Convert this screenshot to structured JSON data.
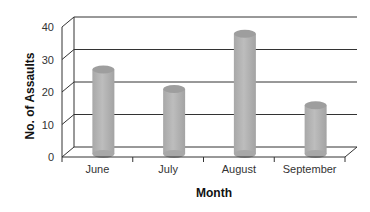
{
  "chart_data": {
    "type": "bar",
    "style": "3d-cylinder",
    "title": "",
    "xlabel": "Month",
    "ylabel": "No. of Assaults",
    "categories": [
      "June",
      "July",
      "August",
      "September"
    ],
    "values": [
      26,
      20,
      37,
      15
    ],
    "ylim": [
      0,
      40
    ],
    "yticks": [
      0,
      10,
      20,
      30,
      40
    ],
    "grid": true,
    "legend": null,
    "bar_color": "#b3b3b3",
    "grid_color": "#333333"
  },
  "labels": {
    "xlabel": "Month",
    "ylabel": "No. of Assaults",
    "yticks": [
      "0",
      "10",
      "20",
      "30",
      "40"
    ],
    "categories": [
      "June",
      "July",
      "August",
      "September"
    ]
  }
}
